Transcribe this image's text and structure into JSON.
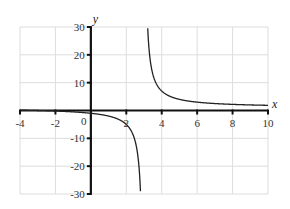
{
  "chart_data": {
    "type": "line",
    "title": "",
    "xlabel": "x",
    "ylabel": "y",
    "xlim": [
      -4,
      10
    ],
    "ylim": [
      -30,
      30
    ],
    "grid": true,
    "legend": null,
    "x_ticks": [
      -4,
      -2,
      0,
      2,
      4,
      6,
      8,
      10
    ],
    "x_tick_labels": [
      "-4",
      "-2",
      "0",
      "2",
      "4",
      "6",
      "8",
      "10"
    ],
    "y_ticks": [
      -30,
      -20,
      -10,
      10,
      20,
      30
    ],
    "y_tick_labels": [
      "-30",
      "-20",
      "-10",
      "10",
      "20",
      "30"
    ],
    "vertical_asymptote": 3,
    "horizontal_asymptote": 1,
    "series": [
      {
        "name": "left branch",
        "x": [
          -4,
          -3,
          -2,
          -1,
          0,
          1,
          2,
          2.5,
          2.8
        ],
        "values": [
          0.14,
          0,
          -0.2,
          -0.5,
          -1,
          -2,
          -5,
          -11,
          -29
        ]
      },
      {
        "name": "right branch",
        "x": [
          3.2,
          3.5,
          4,
          5,
          6,
          7,
          8,
          9,
          10
        ],
        "values": [
          31,
          13,
          7,
          4,
          3,
          2.5,
          2.2,
          2,
          1.86
        ]
      }
    ]
  },
  "labels": {
    "x_axis": "x",
    "y_axis": "y",
    "origin": "0"
  }
}
